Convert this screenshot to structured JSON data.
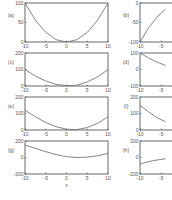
{
  "chart_data": [
    {
      "panel": "(a)",
      "type": "line",
      "x": [
        -10,
        -7.5,
        -5,
        -2.5,
        0,
        2.5,
        5,
        7.5,
        10
      ],
      "series": [
        {
          "name": "(a)",
          "values": [
            100,
            56,
            25,
            6,
            0,
            6,
            25,
            56,
            100
          ]
        }
      ],
      "xlim": [
        -10,
        10
      ],
      "ylim": [
        0,
        100
      ],
      "xticks": [
        "-10",
        "-5",
        "0",
        "5",
        "10"
      ],
      "yticks": [
        "0",
        "50",
        "100"
      ],
      "xlabel": "",
      "ylabel": "(a)",
      "grid": false
    },
    {
      "panel": "(b)",
      "type": "line",
      "x": [
        -10,
        -8,
        -6,
        -4
      ],
      "series": [
        {
          "name": "(b)",
          "values": [
            -100,
            -64,
            -36,
            -16
          ]
        }
      ],
      "xlim": [
        -10,
        10
      ],
      "ylim": [
        -100,
        0
      ],
      "xticks": [
        "-10",
        "-5"
      ],
      "yticks": [
        "-100",
        "-50",
        "0"
      ],
      "xlabel": "",
      "ylabel": "(b)",
      "grid": false
    },
    {
      "panel": "(c)",
      "type": "line",
      "x": [
        -10,
        -7.5,
        -5,
        -2.5,
        0,
        2.5,
        5,
        7.5,
        10
      ],
      "series": [
        {
          "name": "(c)",
          "values": [
            100,
            60,
            30,
            10,
            2,
            5,
            25,
            55,
            100
          ]
        }
      ],
      "xlim": [
        -10,
        10
      ],
      "ylim": [
        0,
        200
      ],
      "xticks": [
        "-10",
        "-5",
        "0",
        "5",
        "10"
      ],
      "yticks": [
        "0",
        "100",
        "200"
      ],
      "xlabel": "",
      "ylabel": "(c)",
      "grid": false
    },
    {
      "panel": "(d)",
      "type": "line",
      "x": [
        -10,
        -8,
        -6,
        -4
      ],
      "series": [
        {
          "name": "(d)",
          "values": [
            100,
            70,
            45,
            25
          ]
        }
      ],
      "xlim": [
        -10,
        10
      ],
      "ylim": [
        -100,
        100
      ],
      "xticks": [
        "-10",
        "-5"
      ],
      "yticks": [
        "-100",
        "0",
        "100"
      ],
      "xlabel": "",
      "ylabel": "(d)",
      "grid": false
    },
    {
      "panel": "(e)",
      "type": "line",
      "x": [
        -10,
        -7.5,
        -5,
        -2.5,
        0,
        2.5,
        5,
        7.5,
        10
      ],
      "series": [
        {
          "name": "(e)",
          "values": [
            120,
            80,
            45,
            20,
            5,
            2,
            15,
            40,
            80
          ]
        }
      ],
      "xlim": [
        -10,
        10
      ],
      "ylim": [
        0,
        200
      ],
      "xticks": [
        "-10",
        "-5",
        "0",
        "5",
        "10"
      ],
      "yticks": [
        "0",
        "100",
        "200"
      ],
      "xlabel": "",
      "ylabel": "(e)",
      "grid": false
    },
    {
      "panel": "(f)",
      "type": "line",
      "x": [
        -10,
        -8,
        -6,
        -4
      ],
      "series": [
        {
          "name": "(f)",
          "values": [
            150,
            110,
            75,
            50
          ]
        }
      ],
      "xlim": [
        -10,
        10
      ],
      "ylim": [
        0,
        200
      ],
      "xticks": [
        "-10",
        "-5"
      ],
      "yticks": [
        "0",
        "100",
        "200"
      ],
      "xlabel": "",
      "ylabel": "(f)",
      "grid": false
    },
    {
      "panel": "(g)",
      "type": "line",
      "x": [
        -10,
        -7.5,
        -5,
        -2.5,
        0,
        2.5,
        5,
        7.5,
        10
      ],
      "series": [
        {
          "name": "(g)",
          "values": [
            150,
            110,
            70,
            35,
            10,
            0,
            5,
            20,
            50
          ]
        }
      ],
      "xlim": [
        -10,
        10
      ],
      "ylim": [
        -200,
        200
      ],
      "xticks": [
        "-10",
        "-5",
        "0",
        "5",
        "10"
      ],
      "yticks": [
        "-200",
        "0",
        "200"
      ],
      "xlabel": "x",
      "ylabel": "(g)",
      "grid": false
    },
    {
      "panel": "(h)",
      "type": "line",
      "x": [
        -10,
        -8,
        -6,
        -4
      ],
      "series": [
        {
          "name": "(h)",
          "values": [
            -80,
            -50,
            -30,
            -15
          ]
        }
      ],
      "xlim": [
        -10,
        10
      ],
      "ylim": [
        -200,
        200
      ],
      "xticks": [
        "-10",
        "-5"
      ],
      "yticks": [
        "-200",
        "0",
        "200"
      ],
      "xlabel": "",
      "ylabel": "(h)",
      "grid": false
    }
  ],
  "labels": {
    "a": "(a)",
    "b": "(b)",
    "c": "(c)",
    "d": "(d)",
    "e": "(e)",
    "f": "(f)",
    "g": "(g)",
    "h": "(h)",
    "xlabel": "x"
  },
  "colors": {
    "axis": "#444444",
    "line": "#777777",
    "text": "#555555"
  }
}
